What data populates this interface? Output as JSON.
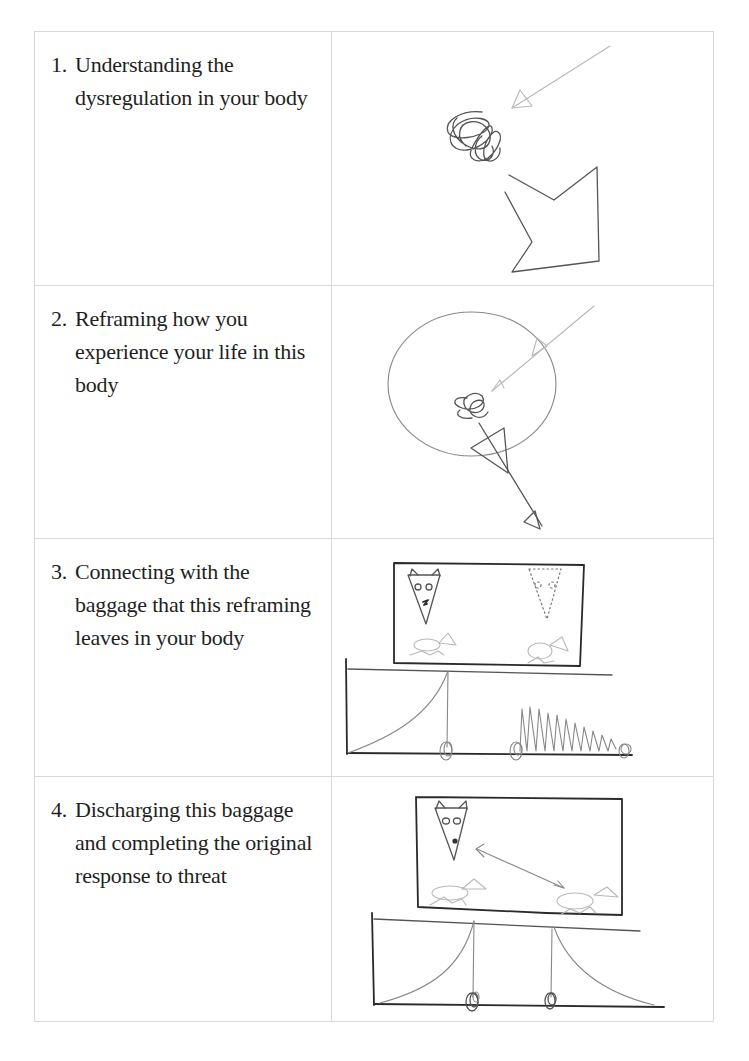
{
  "table": {
    "rows": [
      {
        "number": "1.",
        "text": "Understanding the dysregulation in your body",
        "drawing": "scribble-with-incoming-arrow-and-outgoing-broken-arrow"
      },
      {
        "number": "2.",
        "text": "Reframing how you experience your life in this body",
        "drawing": "circle-with-scribble-and-arrows"
      },
      {
        "number": "3.",
        "text": "Connecting with the baggage that this reframing leaves in your body",
        "drawing": "wolf-and-animals-frame-with-rising-curve-and-oscillation"
      },
      {
        "number": "4.",
        "text": "Discharging this baggage and completing the original response to threat",
        "drawing": "wolf-and-animals-frame-with-completed-bell-curve"
      }
    ]
  },
  "colors": {
    "border": "#d8d8d8",
    "text": "#1f1f1f",
    "pencil_dark": "#2a2a2a",
    "pencil_light": "#b8b8b8"
  }
}
